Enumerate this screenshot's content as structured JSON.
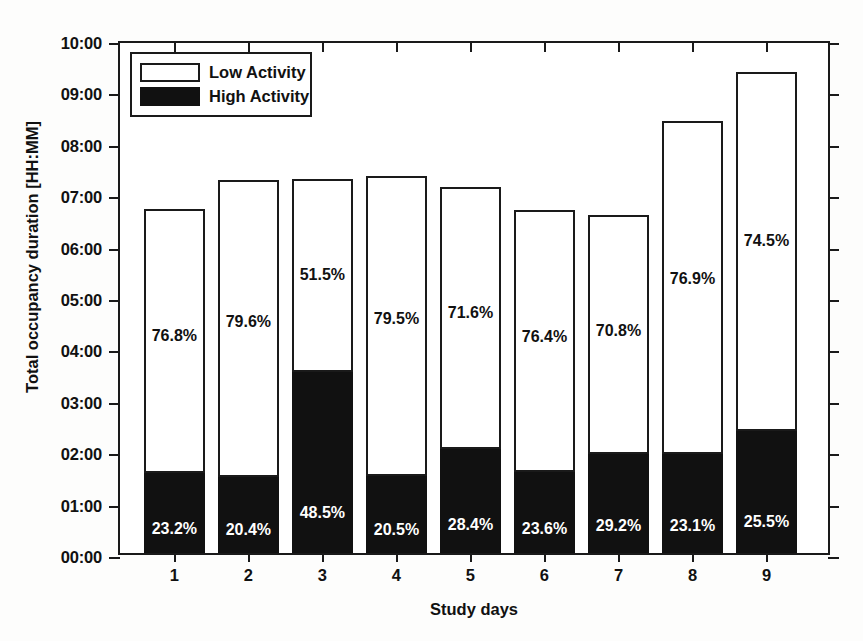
{
  "chart_data": {
    "type": "bar",
    "subtype": "stacked-percentage",
    "title": "",
    "xlabel": "Study days",
    "ylabel": "Total occupancy duration [HH:MM]",
    "categories": [
      "1",
      "2",
      "3",
      "4",
      "5",
      "6",
      "7",
      "8",
      "9"
    ],
    "ylim": [
      0,
      10
    ],
    "y_unit": "hours",
    "y_tick_labels": [
      "00:00",
      "01:00",
      "02:00",
      "03:00",
      "04:00",
      "05:00",
      "06:00",
      "07:00",
      "08:00",
      "09:00",
      "10:00"
    ],
    "y_tick_values": [
      0,
      1,
      2,
      3,
      4,
      5,
      6,
      7,
      8,
      9,
      10
    ],
    "grid": false,
    "legend_position": "top-left",
    "series": [
      {
        "name": "High Activity",
        "color": "#111111",
        "values": [
          1.55,
          1.48,
          3.53,
          1.5,
          2.02,
          1.57,
          1.92,
          1.93,
          2.38
        ],
        "labels": [
          "23.2%",
          "20.4%",
          "48.5%",
          "20.5%",
          "28.4%",
          "23.6%",
          "29.2%",
          "23.1%",
          "25.5%"
        ]
      },
      {
        "name": "Low Activity",
        "color": "#ffffff",
        "values": [
          5.15,
          5.77,
          3.75,
          5.83,
          5.1,
          5.1,
          4.65,
          6.47,
          6.98
        ],
        "labels": [
          "76.8%",
          "79.6%",
          "51.5%",
          "79.5%",
          "71.6%",
          "76.4%",
          "70.8%",
          "76.9%",
          "74.5%"
        ]
      }
    ],
    "totals": [
      6.7,
      7.25,
      7.28,
      7.33,
      7.12,
      6.67,
      6.57,
      8.4,
      9.36
    ]
  },
  "legend": {
    "items": [
      {
        "label": "Low Activity",
        "color": "#ffffff"
      },
      {
        "label": "High Activity",
        "color": "#111111"
      }
    ]
  },
  "axes": {
    "y_title": "Total occupancy duration [HH:MM]",
    "x_title": "Study days"
  },
  "colors": {
    "axis": "#1a1a1a",
    "low_activity": "#ffffff",
    "high_activity": "#111111",
    "background": "#ffffff"
  }
}
